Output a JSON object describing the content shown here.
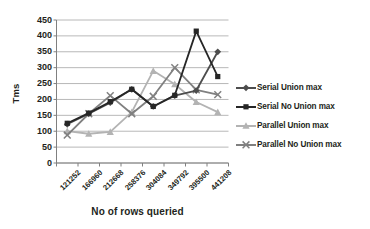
{
  "chart_data": {
    "type": "line",
    "title": "",
    "xlabel": "No of rows queried",
    "ylabel": "Tms",
    "categories": [
      "121252",
      "166960",
      "212668",
      "258376",
      "304084",
      "349792",
      "395500",
      "441208"
    ],
    "ylim": [
      0,
      450
    ],
    "yticks": [
      "0",
      "50",
      "100",
      "150",
      "200",
      "250",
      "300",
      "350",
      "400",
      "450"
    ],
    "grid": true,
    "legend_position": "right",
    "series": [
      {
        "name": "Serial Union max",
        "color": "#4d4d4d",
        "marker": "diamond",
        "values": [
          122,
          155,
          190,
          232,
          178,
          212,
          228,
          350
        ]
      },
      {
        "name": "Serial No Union max",
        "color": "#262626",
        "marker": "square",
        "values": [
          125,
          157,
          193,
          232,
          178,
          213,
          415,
          272
        ]
      },
      {
        "name": "Parallel Union max",
        "color": "#b3b3b3",
        "marker": "triangle",
        "values": [
          100,
          92,
          98,
          160,
          290,
          248,
          192,
          160
        ]
      },
      {
        "name": "Parallel No Union max",
        "color": "#808080",
        "marker": "x",
        "values": [
          88,
          155,
          212,
          155,
          210,
          300,
          230,
          215
        ]
      }
    ]
  },
  "axes": {
    "y_title": "Tms",
    "x_title": "No of rows queried"
  },
  "colors": {
    "grid": "#a6a6a6",
    "axis": "#808080",
    "text": "#231f20",
    "background": "#ffffff"
  }
}
